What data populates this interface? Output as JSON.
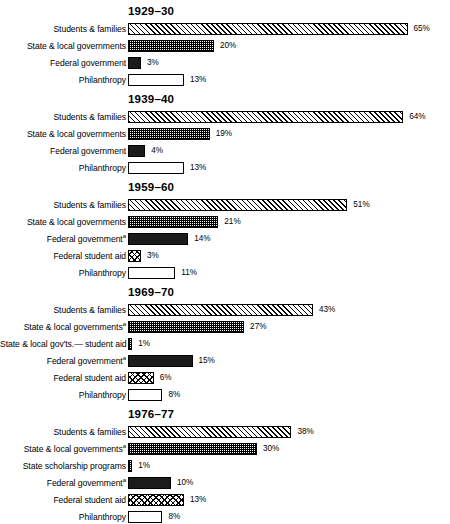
{
  "chart_data": {
    "type": "bar",
    "title": "",
    "xlabel": "",
    "ylabel": "",
    "xlim": [
      0,
      65
    ],
    "grid": false,
    "legend": "none",
    "orientation": "horizontal",
    "value_suffix": "%",
    "px_per_percent": 4.3,
    "panels": [
      {
        "title": "1929–30",
        "categories": [
          "Students & families",
          "State & local governments",
          "Federal government",
          "Philanthropy"
        ],
        "values": [
          65,
          20,
          3,
          13
        ],
        "labels": [
          "65%",
          "20%",
          "3%",
          "13%"
        ],
        "patterns": [
          "pat-diag",
          "pat-stipple",
          "pat-solid",
          "pat-open"
        ],
        "footnotes": [
          "",
          "",
          "",
          ""
        ]
      },
      {
        "title": "1939–40",
        "categories": [
          "Students & families",
          "State & local governments",
          "Federal government",
          "Philanthropy"
        ],
        "values": [
          64,
          19,
          4,
          13
        ],
        "labels": [
          "64%",
          "19%",
          "4%",
          "13%"
        ],
        "patterns": [
          "pat-diag",
          "pat-stipple",
          "pat-solid",
          "pat-open"
        ],
        "footnotes": [
          "",
          "",
          "",
          ""
        ]
      },
      {
        "title": "1959–60",
        "categories": [
          "Students & families",
          "State & local governments",
          "Federal government",
          "Federal student aid",
          "Philanthropy"
        ],
        "values": [
          51,
          21,
          14,
          3,
          11
        ],
        "labels": [
          "51%",
          "21%",
          "14%",
          "3%",
          "11%"
        ],
        "patterns": [
          "pat-diag",
          "pat-stipple",
          "pat-solid",
          "pat-cross",
          "pat-open"
        ],
        "footnotes": [
          "",
          "",
          "a",
          "",
          ""
        ]
      },
      {
        "title": "1969–70",
        "categories": [
          "Students & families",
          "State & local governments",
          "State & local gov'ts.— student aid",
          "Federal government",
          "Federal student aid",
          "Philanthropy"
        ],
        "values": [
          43,
          27,
          1,
          15,
          6,
          8
        ],
        "labels": [
          "43%",
          "27%",
          "1%",
          "15%",
          "6%",
          "8%"
        ],
        "patterns": [
          "pat-diag",
          "pat-stipple",
          "pat-stipple",
          "pat-solid",
          "pat-cross",
          "pat-open"
        ],
        "footnotes": [
          "",
          "a",
          "",
          "a",
          "",
          ""
        ]
      },
      {
        "title": "1976–77",
        "categories": [
          "Students & families",
          "State & local governments",
          "State scholarship programs",
          "Federal government",
          "Federal student aid",
          "Philanthropy"
        ],
        "values": [
          38,
          30,
          1,
          10,
          13,
          8
        ],
        "labels": [
          "38%",
          "30%",
          "1%",
          "10%",
          "13%",
          "8%"
        ],
        "patterns": [
          "pat-diag",
          "pat-stipple",
          "pat-stipple",
          "pat-solid",
          "pat-cross",
          "pat-open"
        ],
        "footnotes": [
          "",
          "a",
          "",
          "a",
          "",
          ""
        ]
      }
    ]
  }
}
